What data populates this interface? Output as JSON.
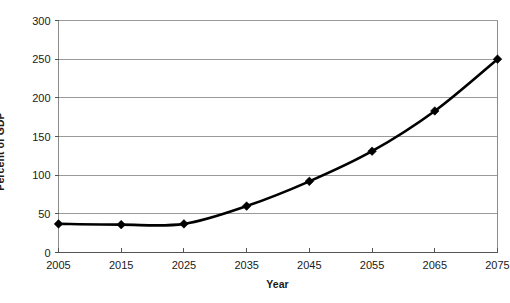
{
  "chart_data": {
    "type": "line",
    "title": "",
    "xlabel": "Year",
    "ylabel": "Percent of GDP",
    "x": [
      2005,
      2015,
      2025,
      2035,
      2045,
      2055,
      2065,
      2075
    ],
    "categories": [
      "2005",
      "2015",
      "2025",
      "2035",
      "2045",
      "2055",
      "2065",
      "2075"
    ],
    "values": [
      37,
      36,
      37,
      60,
      92,
      131,
      183,
      250
    ],
    "series": [
      {
        "name": "Debt held by the public",
        "values": [
          37,
          36,
          37,
          60,
          92,
          131,
          183,
          250
        ]
      }
    ],
    "xlim": [
      2005,
      2075
    ],
    "ylim": [
      0,
      300
    ],
    "xticks": [
      2005,
      2015,
      2025,
      2035,
      2045,
      2055,
      2065,
      2075
    ],
    "yticks": [
      0,
      50,
      100,
      150,
      200,
      250,
      300
    ],
    "xtick_labels": [
      "2005",
      "2015",
      "2025",
      "2035",
      "2045",
      "2055",
      "2065",
      "2075"
    ],
    "ytick_labels": [
      "0",
      "50",
      "100",
      "150",
      "200",
      "250",
      "300"
    ],
    "grid": "horizontal",
    "legend": "none",
    "marker": "diamond",
    "line_color": "#000000",
    "grid_color": "#9a9a9a",
    "background_color": "#ffffff",
    "annotations": []
  }
}
